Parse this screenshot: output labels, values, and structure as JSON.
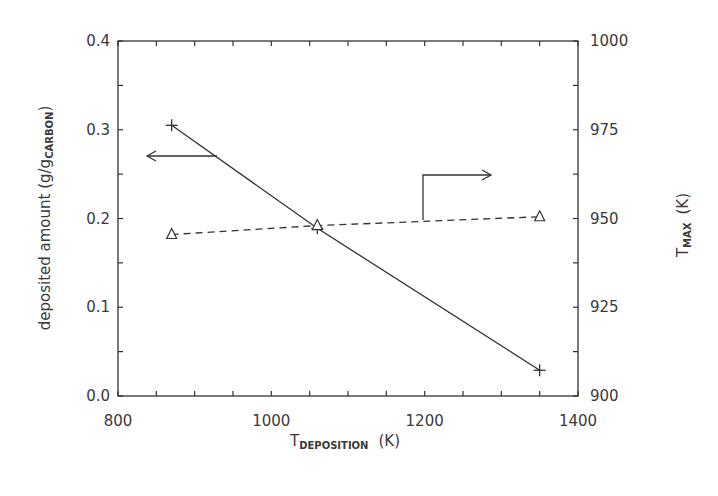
{
  "chart_data": {
    "type": "line",
    "title": "",
    "xlabel": "T_DEPOSITION (K)",
    "xlabel_main": "T",
    "xlabel_sub": "DEPOSITION",
    "xlabel_unit": "(K)",
    "ylabel": "deposited amount (g/g_CARBON)",
    "ylabel_main": "deposited amount (g/g",
    "ylabel_sub": "CARBON",
    "ylabel_end": ")",
    "y2label": "T_MAX (K)",
    "y2label_main": "T",
    "y2label_sub": "MAX",
    "y2label_unit": "(K)",
    "xlim": [
      800,
      1400
    ],
    "ylim": [
      0.0,
      0.4
    ],
    "y2lim": [
      900,
      1000
    ],
    "xticks": [
      "800",
      "1000",
      "1200",
      "1400"
    ],
    "yticks": [
      "0.0",
      "0.1",
      "0.2",
      "0.3",
      "0.4"
    ],
    "y2ticks": [
      "900",
      "925",
      "950",
      "975",
      "1000"
    ],
    "grid": false,
    "legend": "none (arrows indicate axes)",
    "x": [
      870,
      1060,
      1350
    ],
    "series": [
      {
        "name": "deposited amount",
        "axis": "left",
        "style": "solid",
        "marker": "+",
        "values": [
          0.305,
          0.189,
          0.029
        ]
      },
      {
        "name": "T_MAX",
        "axis": "right",
        "style": "dashed",
        "marker": "triangle",
        "values": [
          945.5,
          948,
          950.5
        ]
      }
    ],
    "annotations": [
      {
        "type": "arrow",
        "direction": "left",
        "points_to": "left axis",
        "series": "deposited amount"
      },
      {
        "type": "arrow",
        "direction": "right",
        "points_to": "right axis",
        "series": "T_MAX"
      }
    ]
  }
}
